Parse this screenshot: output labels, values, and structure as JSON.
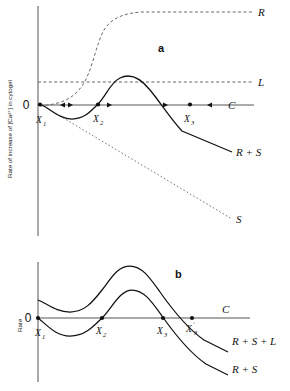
{
  "figure": {
    "panels": [
      {
        "id": "a",
        "label": "a",
        "ylabel": "Rate of increase of [Ca²⁺] in cytogel",
        "origin_label": "0",
        "curves": [
          {
            "name": "R",
            "label": "R",
            "style": "dashed",
            "shape": "sigmoid-rising-plateau"
          },
          {
            "name": "L",
            "label": "L",
            "style": "dashed",
            "shape": "horizontal"
          },
          {
            "name": "S",
            "label": "S",
            "style": "dotted",
            "shape": "linear-descending"
          },
          {
            "name": "C",
            "label": "C",
            "style": "solid",
            "shape": "horizontal-zero-axis"
          },
          {
            "name": "R+S",
            "label": "R + S",
            "style": "solid",
            "shape": "cubic-N-shaped"
          }
        ],
        "fixed_points": [
          {
            "label": "X",
            "sub": "1",
            "stability": "unstable"
          },
          {
            "label": "X",
            "sub": "2",
            "stability": "stable"
          },
          {
            "label": "X",
            "sub": "3",
            "stability": "stable"
          }
        ],
        "flow_arrows": [
          {
            "direction": "right",
            "note": "toward X2 from left"
          },
          {
            "direction": "left",
            "note": "toward X2 from right"
          },
          {
            "direction": "right",
            "note": "away from X2 toward X3"
          },
          {
            "direction": "right",
            "note": "toward X3 from left"
          },
          {
            "direction": "left",
            "note": "toward X3 from right"
          }
        ]
      },
      {
        "id": "b",
        "label": "b",
        "ylabel": "Rate",
        "origin_label": "0",
        "curves": [
          {
            "name": "C",
            "label": "C",
            "style": "solid",
            "shape": "horizontal-zero-axis"
          },
          {
            "name": "R+S+L",
            "label": "R + S + L",
            "style": "solid",
            "shape": "cubic-N-shaped-raised"
          },
          {
            "name": "R+S",
            "label": "R + S",
            "style": "solid",
            "shape": "cubic-N-shaped"
          }
        ],
        "fixed_points": [
          {
            "label": "X",
            "sub": "1"
          },
          {
            "label": "X",
            "sub": "2"
          },
          {
            "label": "X",
            "sub": "3"
          },
          {
            "label": "X",
            "sub": "3",
            "prime": true
          }
        ]
      }
    ]
  },
  "colors": {
    "ink": "#111111",
    "axis": "#555555",
    "dashed": "#666666",
    "dotted": "#777777",
    "background": "#ffffff"
  }
}
